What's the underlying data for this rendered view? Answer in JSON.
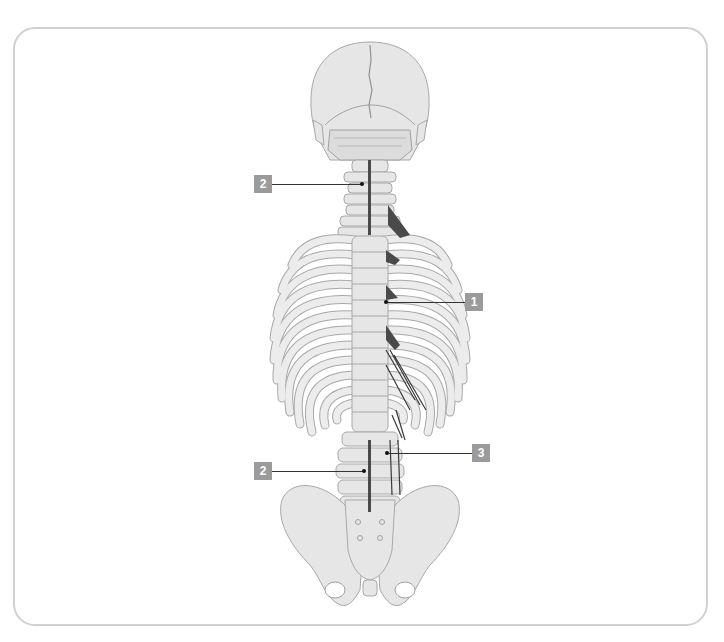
{
  "figure": {
    "view": "posterior skeleton: skull, vertebral column, rib cage, pelvis",
    "colors": {
      "frame_border": "#d0d0d0",
      "bone_fill": "#e6e6e6",
      "bone_stroke": "#a8a8a8",
      "muscle": "#4a4a4a",
      "label_bg": "#9b9b9b",
      "label_text": "#ffffff",
      "leader_line": "#333333"
    }
  },
  "callouts": [
    {
      "id": "c1",
      "label": "2",
      "target": "cervical spine muscle"
    },
    {
      "id": "c2",
      "label": "1",
      "target": "thoracic paraspinal muscle"
    },
    {
      "id": "c3",
      "label": "3",
      "target": "lumbar lateral muscle"
    },
    {
      "id": "c4",
      "label": "2",
      "target": "lumbar spine muscle"
    }
  ]
}
